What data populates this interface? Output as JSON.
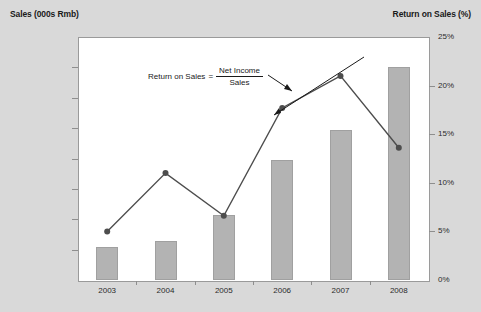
{
  "chart_data": {
    "type": "bar",
    "title": "",
    "categories": [
      "2003",
      "2004",
      "2005",
      "2006",
      "2007",
      "2008"
    ],
    "xlabel": "",
    "series": [
      {
        "name": "Sales (000s Rmb)",
        "type": "bar",
        "axis": "left",
        "values": [
          2200000,
          2600000,
          4300000,
          7900000,
          9900000,
          14000000
        ],
        "color": "#b3b3b3"
      },
      {
        "name": "Return on Sales (%)",
        "type": "line",
        "axis": "right",
        "values": [
          5.0,
          11.0,
          6.6,
          17.7,
          21.0,
          13.6
        ],
        "color": "#4d4d4d"
      }
    ],
    "left_axis": {
      "label": "Sales (000s Rmb)",
      "ylim": [
        0,
        16000000
      ],
      "ticks": [
        "16,000,000",
        "14,000,000",
        "12,000,000",
        "10,000,000",
        "8,000,000",
        "6,000,000",
        "4,000,000",
        "2,000,000",
        "0"
      ],
      "tick_values": [
        16000000,
        14000000,
        12000000,
        10000000,
        8000000,
        6000000,
        4000000,
        2000000,
        0
      ]
    },
    "right_axis": {
      "label": "Return on Sales (%)",
      "ylim": [
        0,
        25
      ],
      "ticks": [
        "25%",
        "20%",
        "15%",
        "10%",
        "5%",
        "0%"
      ],
      "tick_values": [
        25,
        20,
        15,
        10,
        5,
        0
      ]
    },
    "annotation": {
      "lead": "Return on Sales",
      "equals": "=",
      "numerator": "Net Income",
      "denominator": "Sales"
    },
    "grid": false,
    "legend": "none",
    "background": "#d9d9d9",
    "plot_background": "#ffffff"
  }
}
